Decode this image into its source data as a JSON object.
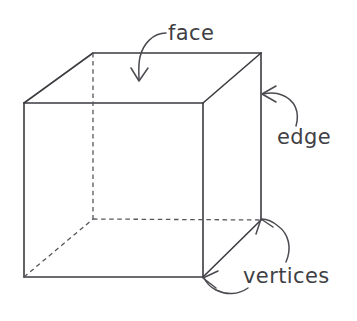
{
  "diagram": {
    "background_color": "#ffffff",
    "line_color": "#3b3b40",
    "hidden_line_color": "#56565c",
    "label_color": "#3f3f45",
    "shape": "cube",
    "annotations": [
      {
        "id": "face",
        "label": "face",
        "label_x": 168,
        "label_y": 40,
        "points_to": "top-face",
        "arrow_tip": [
          139,
          80
        ]
      },
      {
        "id": "edge",
        "label": "edge",
        "label_x": 277,
        "label_y": 144,
        "points_to": "right-vertical-edge",
        "arrow_tip": [
          262,
          94
        ]
      },
      {
        "id": "vertices",
        "label": "vertices",
        "label_x": 243,
        "label_y": 283,
        "points_to": "back-bottom-right-vertex and front-bottom-right-vertex",
        "arrow_tip": [
          262,
          219
        ]
      }
    ],
    "vertices": {
      "front_top_left": [
        24,
        103
      ],
      "front_top_right": [
        203,
        103
      ],
      "front_bottom_left": [
        24,
        277
      ],
      "front_bottom_right": [
        203,
        277
      ],
      "back_top_left": [
        93,
        53
      ],
      "back_top_right": [
        261,
        53
      ],
      "back_bottom_left": [
        93,
        219
      ],
      "back_bottom_right": [
        261,
        220
      ]
    }
  }
}
